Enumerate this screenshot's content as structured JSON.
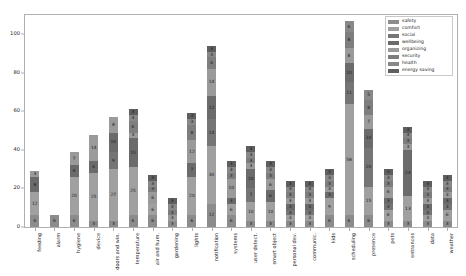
{
  "chart_data": {
    "type": "bar",
    "subtype": "stacked-bar",
    "title": "",
    "xlabel": "",
    "ylabel": "",
    "ylim": [
      0,
      110
    ],
    "yticks": [
      0,
      20,
      40,
      60,
      80,
      100
    ],
    "grid": false,
    "legend_position": "top-right",
    "categories": [
      "feeding",
      "alarm",
      "hygiene",
      "device",
      "doors and win.",
      "temperature",
      "air and hum.",
      "gardening",
      "lights",
      "notification",
      "systems",
      "user detect.",
      "smart object",
      "personal dev.",
      "communic.",
      "kids",
      "scheduling",
      "presence",
      "pets",
      "entrances",
      "data",
      "weather"
    ],
    "series": [
      {
        "name": "safety",
        "color": "#8c8c8c",
        "values": [
          6,
          6,
          6,
          3,
          3,
          6,
          6,
          3,
          6,
          12,
          6,
          3,
          3,
          3,
          3,
          6,
          6,
          6,
          3,
          3,
          3,
          3
        ]
      },
      {
        "name": "comfort",
        "color": "#a0a0a0",
        "values": [
          12,
          0,
          20,
          25,
          27,
          25,
          6,
          0,
          20,
          30,
          6,
          10,
          10,
          3,
          3,
          9,
          58,
          15,
          6,
          13,
          3,
          6
        ]
      },
      {
        "name": "social",
        "color": "#757575",
        "values": [
          0,
          0,
          0,
          0,
          9,
          0,
          0,
          0,
          0,
          14,
          0,
          7,
          0,
          3,
          3,
          0,
          11,
          20,
          3,
          0,
          3,
          3
        ]
      },
      {
        "name": "wellbeing",
        "color": "#6b6b6b",
        "values": [
          8,
          0,
          6,
          6,
          10,
          15,
          0,
          0,
          7,
          12,
          3,
          10,
          6,
          3,
          3,
          3,
          10,
          10,
          3,
          24,
          3,
          3
        ]
      },
      {
        "name": "organizing",
        "color": "#9a9a9a",
        "values": [
          3,
          0,
          7,
          14,
          8,
          3,
          6,
          3,
          12,
          14,
          10,
          3,
          6,
          3,
          3,
          3,
          8,
          7,
          6,
          3,
          3,
          3
        ]
      },
      {
        "name": "security",
        "color": "#7e7e7e",
        "values": [
          0,
          0,
          0,
          0,
          0,
          6,
          3,
          3,
          8,
          6,
          3,
          3,
          3,
          3,
          3,
          3,
          8,
          8,
          3,
          3,
          3,
          3
        ]
      },
      {
        "name": "health",
        "color": "#888888",
        "values": [
          0,
          0,
          0,
          0,
          0,
          3,
          3,
          3,
          3,
          3,
          3,
          3,
          3,
          3,
          3,
          3,
          6,
          5,
          3,
          3,
          3,
          3
        ]
      },
      {
        "name": "energy saving",
        "color": "#5f5f5f",
        "values": [
          0,
          0,
          0,
          0,
          0,
          3,
          3,
          3,
          3,
          3,
          3,
          3,
          3,
          3,
          3,
          3,
          0,
          0,
          3,
          3,
          3,
          3
        ]
      }
    ],
    "totals": [
      29,
      6,
      39,
      48,
      57,
      61,
      27,
      15,
      59,
      94,
      34,
      42,
      34,
      24,
      24,
      30,
      107,
      71,
      30,
      52,
      24,
      27
    ]
  },
  "legend": {
    "items": [
      {
        "label": "safety"
      },
      {
        "label": "comfort"
      },
      {
        "label": "social"
      },
      {
        "label": "wellbeing"
      },
      {
        "label": "organizing"
      },
      {
        "label": "security"
      },
      {
        "label": "health"
      },
      {
        "label": "energy saving"
      }
    ]
  }
}
